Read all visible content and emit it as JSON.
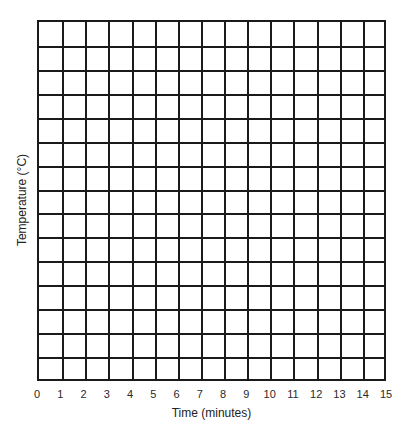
{
  "chart_data": {
    "type": "line",
    "title": "",
    "xlabel": "Time (minutes)",
    "ylabel": "Temperature (°C)",
    "x_ticks": [
      "0",
      "1",
      "2",
      "3",
      "4",
      "5",
      "6",
      "7",
      "8",
      "9",
      "10",
      "11",
      "12",
      "13",
      "14",
      "15"
    ],
    "y_ticks": [],
    "xlim": [
      0,
      15
    ],
    "grid": true,
    "grid_columns": 15,
    "grid_rows": 15,
    "series": [],
    "legend": null,
    "note": "Blank graph grid with no plotted data"
  },
  "colors": {
    "grid_line": "#1a1a1a",
    "text": "#222222",
    "background": "#ffffff"
  }
}
